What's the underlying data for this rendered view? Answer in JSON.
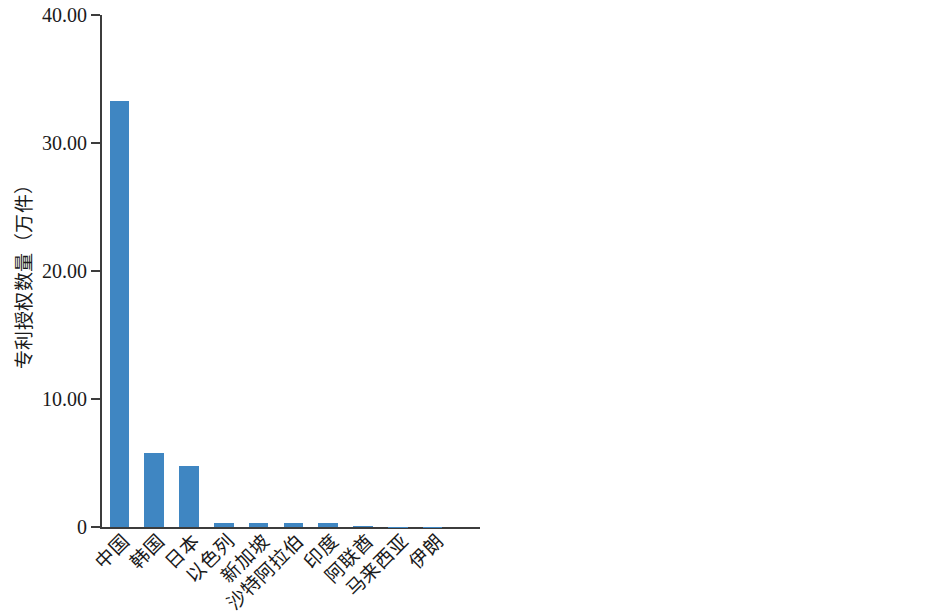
{
  "chart_data": [
    {
      "type": "bar",
      "panel": "left",
      "title": "",
      "xlabel": "",
      "ylabel": "专利授权数量（万件）",
      "ylim": [
        0,
        40
      ],
      "yticks": [
        0,
        10,
        20,
        30,
        40
      ],
      "ytick_labels": [
        "0",
        "10.00",
        "20.00",
        "30.00",
        "40.00"
      ],
      "grid": false,
      "legend": "none",
      "bar_color": "#3f86c2",
      "categories": [
        "中国",
        "韩国",
        "日本",
        "以色列",
        "新加坡",
        "沙特阿拉伯",
        "印度",
        "阿联酋",
        "马来西亚",
        "伊朗"
      ],
      "values": [
        33.3,
        5.8,
        4.75,
        0.3,
        0.3,
        0.3,
        0.3,
        0.05,
        0.03,
        0.02
      ]
    },
    {
      "type": "bar",
      "panel": "right",
      "title": "",
      "xlabel": "",
      "ylabel": "专利授权数量（件）",
      "ylim": [
        0,
        10
      ],
      "yticks": [
        0,
        2,
        4,
        6,
        8,
        10
      ],
      "ytick_labels": [
        "0",
        "2",
        "4",
        "6",
        "8",
        "10"
      ],
      "grid": false,
      "legend": "none",
      "bar_color": "#cf7f37",
      "categories": [
        "文莱",
        "巴林",
        "尼泊尔",
        "塔吉克斯坦",
        "叙利亚",
        "亚美尼亚",
        "阿富汗",
        "缅甸",
        "约旦",
        "柬埔寨"
      ],
      "values": [
        10,
        10,
        10,
        10,
        10,
        10,
        0,
        0,
        0,
        0
      ]
    }
  ]
}
